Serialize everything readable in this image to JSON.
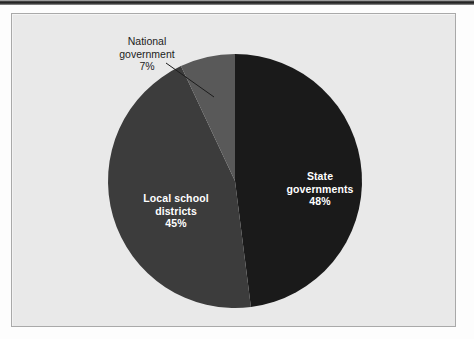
{
  "figure": {
    "panel_background": "#e9e9e9",
    "panel_border": "#a9a9a9"
  },
  "chart_data": {
    "type": "pie",
    "title": "",
    "subtitle": "",
    "xlabel": "",
    "ylabel": "",
    "grid": false,
    "legend_position": "none",
    "units": "percent",
    "total": 100,
    "start_angle_deg": 0,
    "direction": "clockwise",
    "categories": [
      "State governments",
      "Local school districts",
      "National government"
    ],
    "values": [
      48,
      45,
      7
    ],
    "value_labels": [
      "48%",
      "45%",
      "7%"
    ],
    "colors": [
      "#1a1a1a",
      "#3c3c3c",
      "#595959"
    ],
    "label_colors": [
      "#ffffff",
      "#ffffff",
      "#1c1c1c"
    ],
    "label_placement": [
      "inside",
      "inside",
      "outside-leader"
    ],
    "slices": [
      {
        "name": "State governments",
        "value": 48,
        "value_label": "48%",
        "color": "#1a1a1a",
        "label_line_1": "State",
        "label_line_2": "governments",
        "start_angle_deg": 0,
        "end_angle_deg": 172.8
      },
      {
        "name": "Local school districts",
        "value": 45,
        "value_label": "45%",
        "color": "#3c3c3c",
        "label_line_1": "Local school",
        "label_line_2": "districts",
        "start_angle_deg": 172.8,
        "end_angle_deg": 334.8
      },
      {
        "name": "National government",
        "value": 7,
        "value_label": "7%",
        "color": "#595959",
        "label_line_1": "National",
        "label_line_2": "government",
        "start_angle_deg": 334.8,
        "end_angle_deg": 360
      }
    ]
  }
}
